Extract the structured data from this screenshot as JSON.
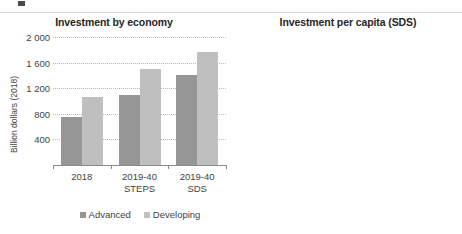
{
  "left_chart": {
    "title": "Investment by economy",
    "ylabel": "Billion dollars (2018)",
    "yticks": [
      "2 000",
      "1 600",
      "1 200",
      "800",
      "400"
    ],
    "categories": [
      {
        "label": "2018",
        "sub": ""
      },
      {
        "label": "2019-40",
        "sub": "STEPS"
      },
      {
        "label": "2019-40",
        "sub": "SDS"
      }
    ],
    "legend": [
      {
        "label": "Advanced",
        "color": "#969696"
      },
      {
        "label": "Developing",
        "color": "#bfbfbf"
      }
    ]
  },
  "right_chart": {
    "title": "Investment per capita (SDS)",
    "ylabel": "Dollars (2018)",
    "yticks": [
      "1 500",
      "1 200",
      "900",
      "600",
      "300"
    ],
    "xticks": [
      "2014",
      "2016",
      "2018",
      "2019-40"
    ],
    "legend": [
      {
        "label": "North America",
        "color": "#808080"
      },
      {
        "label": "China",
        "color": "#262626"
      },
      {
        "label": "India",
        "color": "#595959"
      },
      {
        "label": "Europe",
        "color": "#a6a6a6"
      },
      {
        "label": "Southeast Asia",
        "color": "#000000"
      },
      {
        "label": "Sub-Saharan Africa",
        "color": "#c9c9c9"
      }
    ]
  },
  "chart_data": [
    {
      "type": "bar",
      "title": "Investment by economy",
      "xlabel": "",
      "ylabel": "Billion dollars (2018)",
      "ylim": [
        0,
        2100
      ],
      "yticks": [
        400,
        800,
        1200,
        1600,
        2000
      ],
      "grid": true,
      "legend_position": "bottom",
      "categories": [
        "2018",
        "2019-40 STEPS",
        "2019-40 SDS"
      ],
      "series": [
        {
          "name": "Advanced",
          "color": "#969696",
          "values": [
            760,
            1090,
            1410
          ]
        },
        {
          "name": "Developing",
          "color": "#bfbfbf",
          "values": [
            1060,
            1510,
            1770
          ]
        }
      ]
    },
    {
      "type": "line",
      "title": "Investment per capita (SDS)",
      "xlabel": "",
      "ylabel": "Dollars (2018)",
      "ylim": [
        0,
        1600
      ],
      "yticks": [
        300,
        600,
        900,
        1200,
        1500
      ],
      "grid": true,
      "legend_position": "bottom",
      "x": [
        "2014",
        "2015",
        "2016",
        "2017",
        "2018",
        "2019-40"
      ],
      "note": "Historical segment 2014-2018 drawn solid; projection 2018 to 2019-40 drawn dotted.",
      "series": [
        {
          "name": "North America",
          "color": "#808080",
          "values": [
            1095,
            975,
            895,
            860,
            875,
            1270
          ]
        },
        {
          "name": "Europe",
          "color": "#a6a6a6",
          "values": [
            450,
            450,
            455,
            430,
            415,
            890
          ]
        },
        {
          "name": "China",
          "color": "#262626",
          "values": [
            310,
            305,
            302,
            300,
            295,
            420
          ]
        },
        {
          "name": "Southeast Asia",
          "color": "#000000",
          "values": [
            195,
            190,
            185,
            180,
            178,
            230
          ]
        },
        {
          "name": "India",
          "color": "#595959",
          "values": [
            175,
            172,
            170,
            168,
            165,
            215
          ]
        },
        {
          "name": "Sub-Saharan Africa",
          "color": "#c9c9c9",
          "values": [
            160,
            158,
            157,
            155,
            152,
            200
          ]
        }
      ]
    }
  ]
}
